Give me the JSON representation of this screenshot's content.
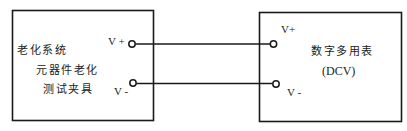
{
  "diagram": {
    "left_box": {
      "title": "老化系统",
      "subtitle_line1": "元器件老化",
      "subtitle_line2": "测试夹具",
      "terminals": {
        "positive_label": "V +",
        "negative_label": "V -"
      }
    },
    "right_box": {
      "title": "数字多用表",
      "mode": "(DCV)",
      "terminals": {
        "positive_label": "V+",
        "negative_label": "V -"
      }
    },
    "connections": [
      {
        "from": "left.V+",
        "to": "right.V+"
      },
      {
        "from": "left.V-",
        "to": "right.V-"
      }
    ],
    "colors": {
      "line": "#1a1a1a",
      "background": "#ffffff"
    }
  }
}
